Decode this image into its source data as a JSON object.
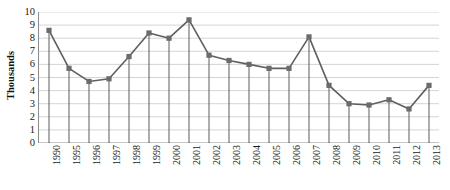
{
  "chart_data": {
    "type": "line",
    "title": "",
    "subtitle": "",
    "xlabel": "",
    "ylabel": "Thousands",
    "categories": [
      "1990",
      "1995",
      "1996",
      "1997",
      "1998",
      "1999",
      "2000",
      "2001",
      "2002",
      "2003",
      "2004",
      "2005",
      "2006",
      "2007",
      "2008",
      "2009",
      "2010",
      "2011",
      "2012",
      "2013"
    ],
    "values": [
      8.6,
      5.7,
      4.7,
      4.9,
      6.6,
      8.4,
      8.0,
      9.4,
      6.7,
      6.3,
      6.0,
      5.7,
      5.7,
      8.1,
      4.4,
      3.0,
      2.9,
      3.3,
      2.6,
      4.4
    ],
    "series": [
      {
        "name": "Series 1",
        "values": [
          8.6,
          5.7,
          4.7,
          4.9,
          6.6,
          8.4,
          8.0,
          9.4,
          6.7,
          6.3,
          6.0,
          5.7,
          5.7,
          8.1,
          4.4,
          3.0,
          2.9,
          3.3,
          2.6,
          4.4
        ]
      }
    ],
    "ylim": [
      0,
      10
    ],
    "ytick_labels": [
      "0",
      "1",
      "2",
      "3",
      "4",
      "5",
      "6",
      "7",
      "8",
      "9",
      "10"
    ],
    "ytick_values": [
      0,
      1,
      2,
      3,
      4,
      5,
      6,
      7,
      8,
      9,
      10
    ],
    "grid": "horizontal",
    "legend": "none",
    "marker": "square",
    "line_color": "#5f5f5f",
    "marker_color": "#6b6b6b",
    "grid_color": "#c9c9c9",
    "axis_color": "#8c8c8c",
    "drop_lines": true,
    "x_label_rotation": -90
  }
}
